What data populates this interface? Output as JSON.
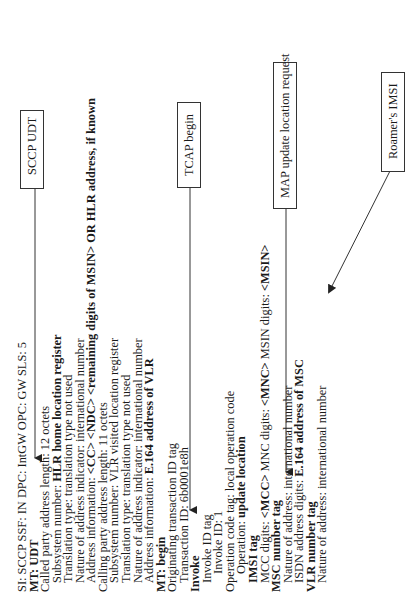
{
  "diagram": {
    "orientation": "rotated-90-ccw",
    "message_lines": [
      {
        "indent": 0,
        "parts": [
          {
            "t": "SI: SCCP  SSF: IN   DPC: IntGW  OPC: GW  SLS: 5",
            "b": false
          }
        ]
      },
      {
        "indent": 0,
        "parts": [
          {
            "t": "MT: UDT",
            "b": true
          }
        ]
      },
      {
        "indent": 0,
        "parts": [
          {
            "t": "Called party address length: 12 octets",
            "b": false
          }
        ]
      },
      {
        "indent": 1,
        "parts": [
          {
            "t": "Subsystem number: ",
            "b": false
          },
          {
            "t": "HLR home location register",
            "b": true
          }
        ]
      },
      {
        "indent": 1,
        "parts": [
          {
            "t": "Translation type: translation type not used",
            "b": false
          }
        ]
      },
      {
        "indent": 1,
        "parts": [
          {
            "t": "Nature of address indicator: international number",
            "b": false
          }
        ]
      },
      {
        "indent": 1,
        "parts": [
          {
            "t": "Address information: ",
            "b": false
          },
          {
            "t": "<CC> <NDC> <remaining digits of MSIN> OR HLR address, if known",
            "b": true
          }
        ]
      },
      {
        "indent": 0,
        "parts": [
          {
            "t": "Calling party address length: 11 octets",
            "b": false
          }
        ]
      },
      {
        "indent": 1,
        "parts": [
          {
            "t": "Subsystem number: VLR visited location register",
            "b": false
          }
        ]
      },
      {
        "indent": 1,
        "parts": [
          {
            "t": "Translation type: translation type not used",
            "b": false
          }
        ]
      },
      {
        "indent": 1,
        "parts": [
          {
            "t": "Nature of address indicator: international number",
            "b": false
          }
        ]
      },
      {
        "indent": 1,
        "parts": [
          {
            "t": "Address information: ",
            "b": false
          },
          {
            "t": "E.164 address of VLR",
            "b": true
          }
        ]
      },
      {
        "indent": 0,
        "parts": [
          {
            "t": "MT: begin",
            "b": true
          }
        ]
      },
      {
        "indent": 0,
        "parts": [
          {
            "t": "Originating transaction ID tag",
            "b": false
          }
        ]
      },
      {
        "indent": 1,
        "parts": [
          {
            "t": "Transaction ID: 6b0001e8h",
            "b": false
          }
        ]
      },
      {
        "indent": 0,
        "parts": [
          {
            "t": "Invoke",
            "b": true
          }
        ]
      },
      {
        "indent": 1,
        "parts": [
          {
            "t": "Invoke ID tag",
            "b": false
          }
        ]
      },
      {
        "indent": 2,
        "parts": [
          {
            "t": "Invoke ID: 1",
            "b": false
          }
        ]
      },
      {
        "indent": 0,
        "parts": [
          {
            "t": "Operation code tag: local operation code",
            "b": false
          }
        ]
      },
      {
        "indent": 2,
        "parts": [
          {
            "t": "Operation: ",
            "b": false
          },
          {
            "t": "update location",
            "b": true
          }
        ]
      },
      {
        "indent": 1,
        "parts": [
          {
            "t": "IMSI tag",
            "b": true
          }
        ]
      },
      {
        "indent": 1,
        "parts": [
          {
            "t": "MCC digits: ",
            "b": false
          },
          {
            "t": "<MCC>",
            "b": true
          },
          {
            "t": "  MNC digits: ",
            "b": false
          },
          {
            "t": "<MNC>",
            "b": true
          },
          {
            "t": "  MSIN digits: ",
            "b": false
          },
          {
            "t": "<MSIN>",
            "b": true
          }
        ]
      },
      {
        "indent": 0,
        "parts": [
          {
            "t": "MSC number tag",
            "b": true
          }
        ]
      },
      {
        "indent": 1,
        "parts": [
          {
            "t": "Nature of address: international number",
            "b": false
          }
        ]
      },
      {
        "indent": 1,
        "parts": [
          {
            "t": "ISDN address digits: ",
            "b": false
          },
          {
            "t": "E.164 address of MSC",
            "b": true
          }
        ]
      },
      {
        "indent": 0,
        "parts": [
          {
            "t": "VLR number tag",
            "b": true
          }
        ]
      },
      {
        "indent": 1,
        "parts": [
          {
            "t": "Nature of address: international number",
            "b": false
          }
        ]
      }
    ],
    "callouts": [
      {
        "id": "sccp",
        "label": "SCCP UDT"
      },
      {
        "id": "tcap",
        "label": "TCAP begin"
      },
      {
        "id": "map",
        "label": "MAP update location request"
      },
      {
        "id": "imsi",
        "label": "Roamer's IMSI"
      }
    ],
    "colors": {
      "text": "#1a1a1a",
      "line": "#333333",
      "background": "#ffffff"
    }
  }
}
